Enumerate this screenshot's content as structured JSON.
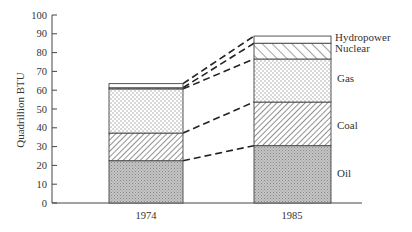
{
  "chart_data": {
    "type": "bar",
    "stacked": true,
    "title": "",
    "xlabel": "",
    "ylabel": "Quadrillion BTU",
    "ylim": [
      0,
      100
    ],
    "yticks": [
      0,
      10,
      20,
      30,
      40,
      50,
      60,
      70,
      80,
      90,
      100
    ],
    "categories": [
      "1974",
      "1985"
    ],
    "series": [
      {
        "name": "Oil",
        "values": [
          22.5,
          30.5
        ],
        "pattern": "fine-dot-dense"
      },
      {
        "name": "Coal",
        "values": [
          14.7,
          23.2
        ],
        "pattern": "diagonal-hatch-fine"
      },
      {
        "name": "Gas",
        "values": [
          23.5,
          22.9
        ],
        "pattern": "dots-sparse"
      },
      {
        "name": "Nuclear",
        "values": [
          0.6,
          8.4
        ],
        "pattern": "diagonal-hatch-wide"
      },
      {
        "name": "Hydropower",
        "values": [
          2.2,
          3.8
        ],
        "pattern": "blank"
      }
    ],
    "totals": [
      63.5,
      88.8
    ],
    "connectors": "dashed lines joining segment tops between bars",
    "legend_position": "right of 1985 bar (inline labels)",
    "grid": false
  },
  "labels": {
    "ylabel": "Quadrillion BTU",
    "x": [
      "1974",
      "1985"
    ],
    "series": [
      "Oil",
      "Coal",
      "Gas",
      "Nuclear",
      "Hydropower"
    ]
  },
  "colors": {
    "axis": "#444444",
    "text": "#333333",
    "oil_fill": "#bdbdbd",
    "outline": "#444444"
  }
}
